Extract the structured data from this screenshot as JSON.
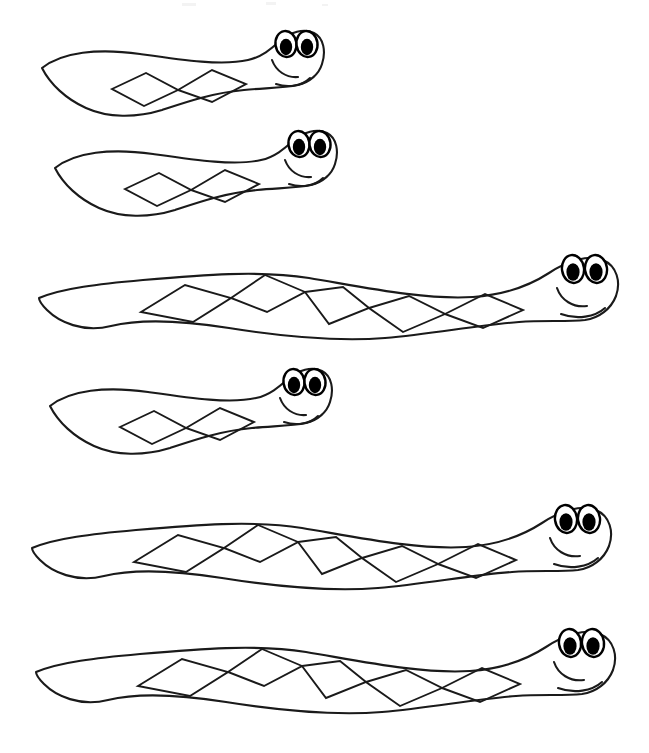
{
  "page": {
    "background_color": "#ffffff",
    "width": 649,
    "height": 753,
    "line_color": "#1a1a1a",
    "fill_color": "#ffffff",
    "pupil_color": "#000000"
  },
  "figures": [
    {
      "name": "snake-1",
      "label": "Short snake 1",
      "size": "short",
      "diamond_count": 2,
      "left": 36,
      "top": 22,
      "width": 292,
      "height": 98
    },
    {
      "name": "snake-2",
      "label": "Short snake 2",
      "size": "short",
      "diamond_count": 2,
      "left": 49,
      "top": 122,
      "width": 292,
      "height": 98
    },
    {
      "name": "snake-3",
      "label": "Long snake 1",
      "size": "long",
      "diamond_count": 5,
      "left": 33,
      "top": 238,
      "width": 592,
      "height": 108
    },
    {
      "name": "snake-4",
      "label": "Short snake 3",
      "size": "short",
      "diamond_count": 2,
      "left": 44,
      "top": 360,
      "width": 292,
      "height": 98
    },
    {
      "name": "snake-5",
      "label": "Long snake 2",
      "size": "long",
      "diamond_count": 5,
      "left": 26,
      "top": 488,
      "width": 592,
      "height": 108
    },
    {
      "name": "snake-6",
      "label": "Long snake 3",
      "size": "long",
      "diamond_count": 5,
      "left": 30,
      "top": 612,
      "width": 592,
      "height": 108
    }
  ],
  "specks": [
    {
      "left": 182,
      "top": 3,
      "width": 14,
      "height": 3
    },
    {
      "left": 266,
      "top": 2,
      "width": 10,
      "height": 3
    },
    {
      "left": 322,
      "top": 4,
      "width": 6,
      "height": 2
    }
  ]
}
